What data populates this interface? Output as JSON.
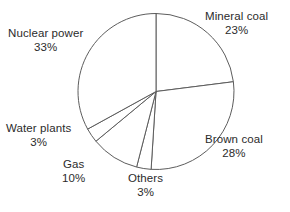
{
  "chart_data": {
    "type": "pie",
    "title": "",
    "subtitle": "",
    "xlabel": "",
    "ylabel": "",
    "legend_position": "none",
    "grid": false,
    "unit": "%",
    "start_angle_deg": 0,
    "direction": "clockwise",
    "categories": [
      "Mineral coal",
      "Brown coal",
      "Others",
      "Gas",
      "Water plants",
      "Nuclear power"
    ],
    "values": [
      23,
      28,
      3,
      10,
      3,
      33
    ],
    "slices": [
      {
        "label": "Mineral coal",
        "value": 23,
        "value_text": "23%",
        "label_x": 205,
        "label_y": 10,
        "align": "center"
      },
      {
        "label": "Brown coal",
        "value": 28,
        "value_text": "28%",
        "label_x": 205,
        "label_y": 133,
        "align": "center"
      },
      {
        "label": "Others",
        "value": 3,
        "value_text": "3%",
        "label_x": 128,
        "label_y": 172,
        "align": "center"
      },
      {
        "label": "Gas",
        "value": 10,
        "value_text": "10%",
        "label_x": 62,
        "label_y": 158,
        "align": "center"
      },
      {
        "label": "Water plants",
        "value": 3,
        "value_text": "3%",
        "label_x": 6,
        "label_y": 122,
        "align": "center"
      },
      {
        "label": "Nuclear power",
        "value": 33,
        "value_text": "33%",
        "label_x": 8,
        "label_y": 27,
        "align": "center"
      }
    ],
    "geometry": {
      "center_x": 156,
      "center_y": 91.5,
      "radius": 78
    },
    "colors": {
      "slice_fill": "#ffffff",
      "slice_stroke": "#5d5d5d",
      "text": "#2b2b2b",
      "background": "#ffffff"
    }
  }
}
